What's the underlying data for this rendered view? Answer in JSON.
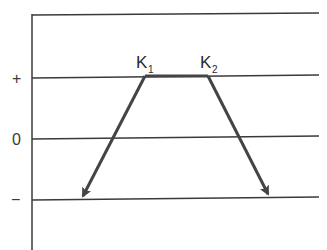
{
  "diagram": {
    "axis_labels": {
      "plus": "+",
      "zero": "0",
      "minus": "−"
    },
    "points": {
      "k1": {
        "letter": "K",
        "subscript": "1"
      },
      "k2": {
        "letter": "K",
        "subscript": "2"
      }
    },
    "levels": [
      "top",
      "+",
      "0",
      "−"
    ],
    "arrows": [
      {
        "from": "K1",
        "to": "− level (left)"
      },
      {
        "from": "K2",
        "to": "− level (right)"
      }
    ],
    "colors": {
      "line": "#3a3a3a",
      "arrow": "#444444",
      "background": "#ffffff"
    }
  }
}
